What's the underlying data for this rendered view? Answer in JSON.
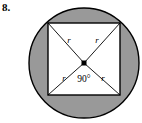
{
  "problem": {
    "number": "8."
  },
  "figure": {
    "name": "circle-with-inscribed-square",
    "colors": {
      "shaded_region": "#999999",
      "inner_region": "#ffffff",
      "stroke": "#000000",
      "background": "#ffffff"
    },
    "circle": {
      "center_x": 84,
      "center_y": 63,
      "radius": 55
    },
    "square": {
      "left": 48,
      "top": 23,
      "size": 72
    },
    "center_point": {
      "x": 84,
      "y": 63,
      "size": 5
    },
    "radius_labels": [
      {
        "text": "r",
        "x": 69,
        "y": 43
      },
      {
        "text": "r",
        "x": 97,
        "y": 43
      },
      {
        "text": "r",
        "x": 64,
        "y": 81
      },
      {
        "text": "r",
        "x": 103,
        "y": 81
      }
    ],
    "angle_label": {
      "text": "90°",
      "x": 84,
      "y": 82
    }
  }
}
